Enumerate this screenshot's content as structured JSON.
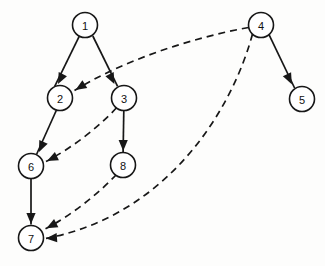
{
  "diagram": {
    "type": "directed-graph",
    "canvas": {
      "width": 325,
      "height": 266,
      "background": "#fdfdfc"
    },
    "style": {
      "node_fill": "#ffffff",
      "node_stroke": "#171717",
      "edge_color": "#171717",
      "node_radius": 12.5
    },
    "nodes": [
      {
        "id": "1",
        "label": "1",
        "x": 85,
        "y": 25
      },
      {
        "id": "2",
        "label": "2",
        "x": 60,
        "y": 98
      },
      {
        "id": "3",
        "label": "3",
        "x": 124,
        "y": 98
      },
      {
        "id": "4",
        "label": "4",
        "x": 261,
        "y": 25
      },
      {
        "id": "5",
        "label": "5",
        "x": 302,
        "y": 99
      },
      {
        "id": "6",
        "label": "6",
        "x": 31,
        "y": 166
      },
      {
        "id": "7",
        "label": "7",
        "x": 31,
        "y": 238
      },
      {
        "id": "8",
        "label": "8",
        "x": 123,
        "y": 165
      }
    ],
    "edges": [
      {
        "id": "e1",
        "from": "1",
        "to": "2",
        "style": "solid",
        "directed": true,
        "path": "M 79.2 36.3 L 54.6 86.6",
        "arrow_x": 58.0,
        "arrow_y": 84.0,
        "arrow_angle": 116
      },
      {
        "id": "e2",
        "from": "1",
        "to": "3",
        "style": "solid",
        "directed": true,
        "path": "M 92.8 36.0 L 117.6 86.4",
        "arrow_x": 114.4,
        "arrow_y": 84.0,
        "arrow_angle": 64
      },
      {
        "id": "e3",
        "from": "2",
        "to": "6",
        "style": "solid",
        "directed": true,
        "path": "M 56.5 110.0 L 36.5 154.5",
        "arrow_x": 39.0,
        "arrow_y": 152.0,
        "arrow_angle": 114
      },
      {
        "id": "e4",
        "from": "3",
        "to": "8",
        "style": "solid",
        "directed": true,
        "path": "M 123.8 110.5 L 123.1 152.5",
        "arrow_x": 123.2,
        "arrow_y": 151.0,
        "arrow_angle": 90
      },
      {
        "id": "e5",
        "from": "6",
        "to": "7",
        "style": "solid",
        "directed": true,
        "path": "M 31 178.5 L 31 224.5",
        "arrow_x": 31,
        "arrow_y": 224.0,
        "arrow_angle": 90
      },
      {
        "id": "e6",
        "from": "4",
        "to": "5",
        "style": "solid",
        "directed": true,
        "path": "M 269.0 34.7 L 294.6 88.0",
        "arrow_x": 291.8,
        "arrow_y": 84.2,
        "arrow_angle": 64
      },
      {
        "id": "e7",
        "from": "4",
        "to": "2",
        "style": "dashed",
        "directed": true,
        "path": "M 248.6 27.5 C 190 38, 120 62, 74.5 90.5",
        "arrow_x": 75.5,
        "arrow_y": 90.0,
        "arrow_angle": 148
      },
      {
        "id": "e8",
        "from": "3",
        "to": "6",
        "style": "dashed",
        "directed": true,
        "path": "M 116.5 107.8 C 100 126, 72 148, 46.0 161.5",
        "arrow_x": 47.0,
        "arrow_y": 161.0,
        "arrow_angle": 154
      },
      {
        "id": "e9",
        "from": "8",
        "to": "7",
        "style": "dashed",
        "directed": true,
        "path": "M 116.5 174.5 C 96 196, 70 216, 45.5 228.8",
        "arrow_x": 46.5,
        "arrow_y": 228.3,
        "arrow_angle": 152
      },
      {
        "id": "e10",
        "from": "4",
        "to": "7",
        "style": "dashed",
        "directed": true,
        "path": "M 252.5 34.0 C 232 110, 168 215, 46.0 238.4",
        "arrow_x": 46.0,
        "arrow_y": 238.4,
        "arrow_angle": 176
      }
    ]
  }
}
